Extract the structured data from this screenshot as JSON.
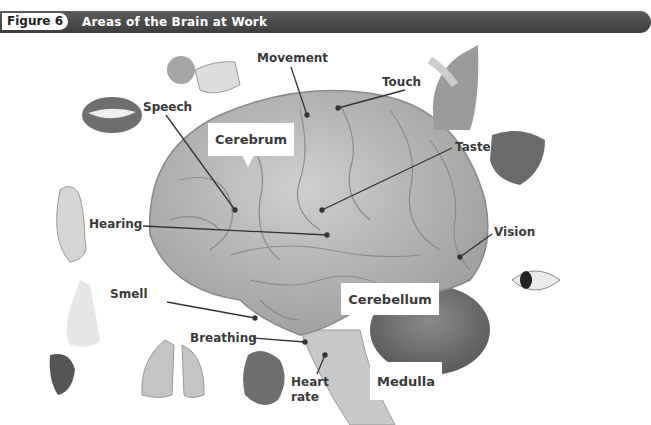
{
  "header": {
    "figure_label": "Figure 6",
    "title": "Areas of the Brain at Work",
    "bar_color": "#4a4a4a"
  },
  "callouts": {
    "cerebrum": "Cerebrum",
    "cerebellum": "Cerebellum",
    "medulla": "Medulla"
  },
  "labels": {
    "movement": "Movement",
    "touch": "Touch",
    "speech": "Speech",
    "taste": "Taste",
    "hearing": "Hearing",
    "vision": "Vision",
    "smell": "Smell",
    "breathing": "Breathing",
    "heart_rate_1": "Heart",
    "heart_rate_2": "rate"
  },
  "icons": [
    "mouth-icon",
    "hand-ball-icon",
    "cat-petting-icon",
    "tongue-icon",
    "ear-icon",
    "eye-icon",
    "nose-icon",
    "lungs-icon",
    "heart-icon",
    "brain-illustration"
  ]
}
